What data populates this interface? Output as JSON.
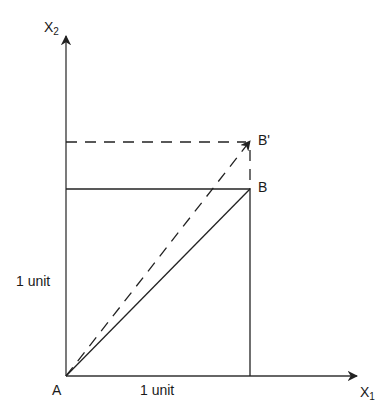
{
  "diagram": {
    "type": "vector-shear-diagram",
    "axes": {
      "x_label": "X",
      "x_subscript": "1",
      "y_label": "X",
      "y_subscript": "2"
    },
    "points": {
      "origin": "A",
      "corner": "B",
      "transformed_corner": "B'"
    },
    "unit_labels": {
      "horizontal": "1 unit",
      "vertical": "1 unit"
    },
    "line_styles": {
      "solid": "#222222",
      "dashed": "#222222"
    }
  }
}
